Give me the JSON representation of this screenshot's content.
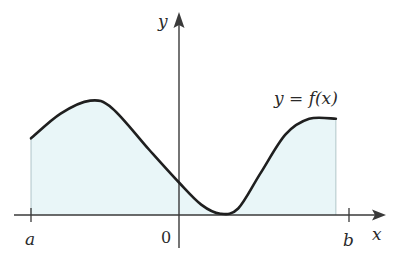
{
  "chart_data": {
    "type": "area",
    "title": "",
    "curve_label": "y = f(x)",
    "xlabel": "x",
    "ylabel": "y",
    "origin_label": "0",
    "interval": {
      "left_label": "a",
      "right_label": "b"
    },
    "shaded_region": "area under y = f(x) from a to b",
    "x_ticks": [
      "a",
      "0",
      "b"
    ],
    "x_range": [
      -1.0,
      1.3
    ],
    "y_range": [
      0,
      1.3
    ],
    "curve_points": [
      {
        "x": -1.0,
        "y": 0.59
      },
      {
        "x": -0.8,
        "y": 0.78
      },
      {
        "x": -0.6,
        "y": 0.88
      },
      {
        "x": -0.45,
        "y": 0.82
      },
      {
        "x": -0.2,
        "y": 0.5
      },
      {
        "x": 0.0,
        "y": 0.25
      },
      {
        "x": 0.15,
        "y": 0.08
      },
      {
        "x": 0.28,
        "y": 0.01
      },
      {
        "x": 0.4,
        "y": 0.05
      },
      {
        "x": 0.55,
        "y": 0.32
      },
      {
        "x": 0.72,
        "y": 0.62
      },
      {
        "x": 0.88,
        "y": 0.74
      },
      {
        "x": 1.06,
        "y": 0.74
      }
    ],
    "grid": false,
    "legend": "none"
  },
  "colors": {
    "curve": "#1f1f1f",
    "axis": "#3a3a3a",
    "fill": "#e9f6f8",
    "bound": "#9fb8bc"
  }
}
